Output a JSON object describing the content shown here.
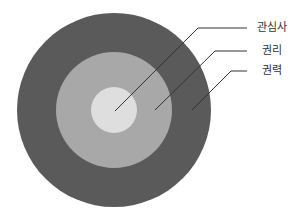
{
  "diagram": {
    "type": "concentric-circles",
    "center": [
      114,
      110
    ],
    "rings": [
      {
        "name": "권력",
        "radius": 97,
        "color": "#5a5a5a"
      },
      {
        "name": "권리",
        "radius": 58,
        "color": "#a8a8a8"
      },
      {
        "name": "관심사",
        "radius": 23,
        "color": "#dedede"
      }
    ],
    "line_color": "#333333",
    "labels": [
      {
        "text": "관심사",
        "x": 252,
        "y": 22,
        "line": {
          "x1": 115,
          "y1": 111,
          "x2": 198,
          "y2": 28,
          "x3": 247
        }
      },
      {
        "text": "권리",
        "x": 252,
        "y": 45,
        "line": {
          "x1": 155,
          "y1": 110,
          "x2": 215,
          "y2": 51,
          "x3": 247
        }
      },
      {
        "text": "권력",
        "x": 252,
        "y": 65,
        "line": {
          "x1": 192,
          "y1": 110,
          "x2": 231,
          "y2": 71,
          "x3": 247
        }
      }
    ]
  }
}
